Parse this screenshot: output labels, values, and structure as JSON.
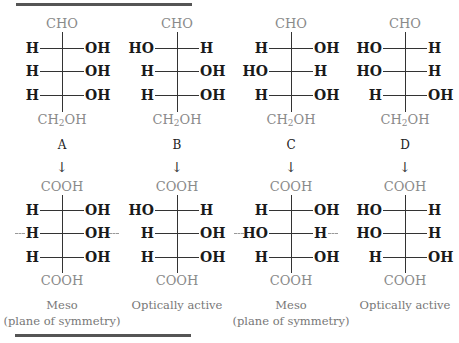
{
  "figure": {
    "top_rule_color": "#555555",
    "structures": [
      {
        "label": "A",
        "aldose": {
          "top": "CHO",
          "rows": [
            [
              "H",
              "OH"
            ],
            [
              "H",
              "OH"
            ],
            [
              "H",
              "OH"
            ]
          ],
          "bottom_main": "CH",
          "bottom_sub": "2",
          "bottom_tail": "OH"
        },
        "arrow": "↓",
        "acid": {
          "top": "COOH",
          "rows": [
            [
              "H",
              "OH"
            ],
            [
              "H",
              "OH"
            ],
            [
              "H",
              "OH"
            ]
          ],
          "bottom": "COOH",
          "symmetry_row": 1
        },
        "caption_line1": "Meso",
        "caption_line2": "(plane of symmetry)"
      },
      {
        "label": "B",
        "aldose": {
          "top": "CHO",
          "rows": [
            [
              "HO",
              "H"
            ],
            [
              "H",
              "OH"
            ],
            [
              "H",
              "OH"
            ]
          ],
          "bottom_main": "CH",
          "bottom_sub": "2",
          "bottom_tail": "OH"
        },
        "arrow": "↓",
        "acid": {
          "top": "COOH",
          "rows": [
            [
              "HO",
              "H"
            ],
            [
              "H",
              "OH"
            ],
            [
              "H",
              "OH"
            ]
          ],
          "bottom": "COOH",
          "symmetry_row": null
        },
        "caption_line1": "Optically active",
        "caption_line2": ""
      },
      {
        "label": "C",
        "aldose": {
          "top": "CHO",
          "rows": [
            [
              "H",
              "OH"
            ],
            [
              "HO",
              "H"
            ],
            [
              "H",
              "OH"
            ]
          ],
          "bottom_main": "CH",
          "bottom_sub": "2",
          "bottom_tail": "OH"
        },
        "arrow": "↓",
        "acid": {
          "top": "COOH",
          "rows": [
            [
              "H",
              "OH"
            ],
            [
              "HO",
              "H"
            ],
            [
              "H",
              "OH"
            ]
          ],
          "bottom": "COOH",
          "symmetry_row": 1
        },
        "caption_line1": "Meso",
        "caption_line2": "(plane of symmetry)"
      },
      {
        "label": "D",
        "aldose": {
          "top": "CHO",
          "rows": [
            [
              "HO",
              "H"
            ],
            [
              "HO",
              "H"
            ],
            [
              "H",
              "OH"
            ]
          ],
          "bottom_main": "CH",
          "bottom_sub": "2",
          "bottom_tail": "OH"
        },
        "arrow": "↓",
        "acid": {
          "top": "COOH",
          "rows": [
            [
              "HO",
              "H"
            ],
            [
              "HO",
              "H"
            ],
            [
              "H",
              "OH"
            ]
          ],
          "bottom": "COOH",
          "symmetry_row": null
        },
        "caption_line1": "Optically active",
        "caption_line2": ""
      }
    ]
  }
}
